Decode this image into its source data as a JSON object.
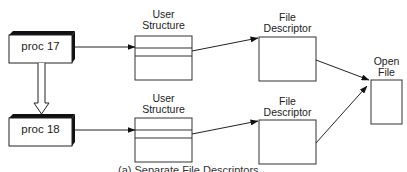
{
  "diagram": {
    "processes": [
      {
        "id": "proc17",
        "label": "proc 17"
      },
      {
        "id": "proc18",
        "label": "proc 18"
      }
    ],
    "user_structures": [
      {
        "label_line1": "User",
        "label_line2": "Structure"
      },
      {
        "label_line1": "User",
        "label_line2": "Structure"
      }
    ],
    "file_descriptors": [
      {
        "label_line1": "File",
        "label_line2": "Descriptor"
      },
      {
        "label_line1": "File",
        "label_line2": "Descriptor"
      }
    ],
    "open_file": {
      "label_line1": "Open",
      "label_line2": "File"
    },
    "caption": "(a) Separate File Descriptors",
    "edges": [
      {
        "from": "proc 17",
        "to": "User Structure (top)"
      },
      {
        "from": "User Structure (top)",
        "to": "File Descriptor (top)"
      },
      {
        "from": "File Descriptor (top)",
        "to": "Open File"
      },
      {
        "from": "proc 17",
        "to": "proc 18",
        "style": "hollow"
      },
      {
        "from": "proc 18",
        "to": "User Structure (bottom)"
      },
      {
        "from": "User Structure (bottom)",
        "to": "File Descriptor (bottom)"
      },
      {
        "from": "File Descriptor (bottom)",
        "to": "Open File"
      }
    ]
  }
}
